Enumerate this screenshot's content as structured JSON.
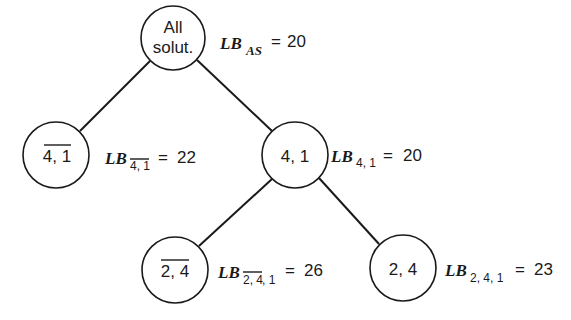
{
  "diagram": {
    "type": "branch-and-bound tree",
    "nodes": [
      {
        "id": "root",
        "label_lines": [
          "All",
          "solut."
        ],
        "overlined": false,
        "bound_prefix": "LB",
        "bound_subscript": "AS",
        "bound_subscript_overline": "",
        "bound_subscript_rest": "",
        "equals": "=",
        "bound_value": "20"
      },
      {
        "id": "not-4-1",
        "label": "4, 1",
        "overlined": true,
        "bound_prefix": "LB",
        "bound_subscript": "",
        "bound_subscript_overline": "4, 1",
        "bound_subscript_rest": "",
        "equals": "=",
        "bound_value": "22"
      },
      {
        "id": "4-1",
        "label": "4, 1",
        "overlined": false,
        "bound_prefix": "LB",
        "bound_subscript": "4, 1",
        "bound_subscript_overline": "",
        "bound_subscript_rest": "",
        "equals": "=",
        "bound_value": "20"
      },
      {
        "id": "not-2-4",
        "label": "2, 4",
        "overlined": true,
        "bound_prefix": "LB",
        "bound_subscript": "",
        "bound_subscript_overline": "2, 4",
        "bound_subscript_rest": ", 1",
        "equals": "=",
        "bound_value": "26"
      },
      {
        "id": "2-4",
        "label": "2, 4",
        "overlined": false,
        "bound_prefix": "LB",
        "bound_subscript": "2, 4, 1",
        "bound_subscript_overline": "",
        "bound_subscript_rest": "",
        "equals": "=",
        "bound_value": "23"
      }
    ],
    "edges": [
      {
        "from": "root",
        "to": "not-4-1"
      },
      {
        "from": "root",
        "to": "4-1"
      },
      {
        "from": "4-1",
        "to": "not-2-4"
      },
      {
        "from": "4-1",
        "to": "2-4"
      }
    ]
  }
}
